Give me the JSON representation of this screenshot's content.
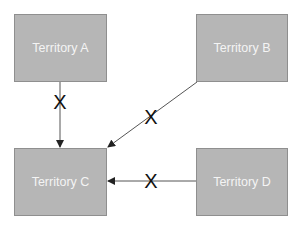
{
  "diagram": {
    "nodes": [
      {
        "id": "A",
        "label": "Territory A"
      },
      {
        "id": "B",
        "label": "Territory B"
      },
      {
        "id": "C",
        "label": "Territory C"
      },
      {
        "id": "D",
        "label": "Territory D"
      }
    ],
    "edges": [
      {
        "from": "A",
        "to": "C",
        "marker": "X",
        "blocked": true
      },
      {
        "from": "B",
        "to": "C",
        "marker": "X",
        "blocked": true
      },
      {
        "from": "D",
        "to": "C",
        "marker": "X",
        "blocked": true
      }
    ],
    "colors": {
      "box_fill": "#b6b6b6",
      "box_border": "#8f8f8f",
      "box_text": "#f4f4f4",
      "arrow": "#555555",
      "x_mark": "#111111"
    }
  }
}
